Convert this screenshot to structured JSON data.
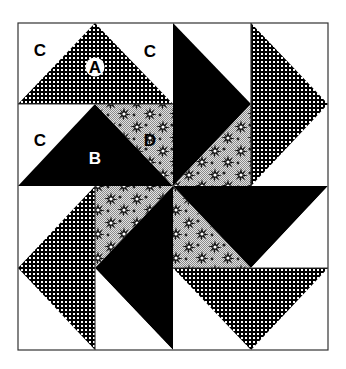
{
  "diagram": {
    "type": "quilt-block-pinwheel",
    "colors": {
      "background": "#ffffff",
      "outline": "#333333",
      "solid_dark": "#000000",
      "checker_bg": "#000000",
      "checker_dot": "#ffffff",
      "floral_bg": "#c8c8c8",
      "floral_motif": "#111111"
    },
    "labels": {
      "c1": "C",
      "a": "A",
      "c2": "C",
      "c3": "C",
      "b": "B",
      "d": "D"
    },
    "fabrics": [
      {
        "id": "A",
        "description": "checkered (black with white dots) triangle"
      },
      {
        "id": "B",
        "description": "solid black triangle"
      },
      {
        "id": "C",
        "description": "white corner triangle"
      },
      {
        "id": "D",
        "description": "light gray floral triangle"
      }
    ]
  }
}
